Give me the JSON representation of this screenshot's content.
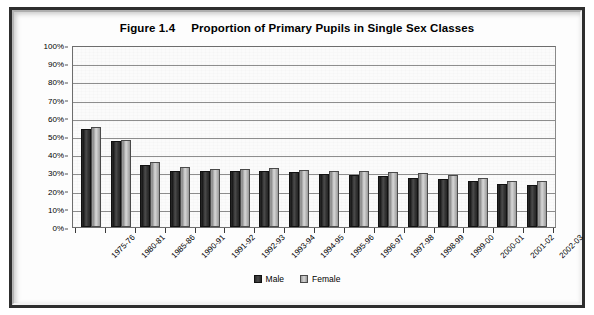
{
  "chart_data": {
    "type": "bar",
    "title_figure": "Figure 1.4",
    "title_text": "Proportion of Primary Pupils in Single Sex Classes",
    "xlabel": "",
    "ylabel": "",
    "ylim": [
      0,
      100
    ],
    "ytick_step": 10,
    "grid": true,
    "legend_position": "bottom-center",
    "y_ticks": [
      "0%",
      "10%",
      "20%",
      "30%",
      "40%",
      "50%",
      "60%",
      "70%",
      "80%",
      "90%",
      "100%"
    ],
    "categories": [
      "1975-76",
      "1980-81",
      "1985-86",
      "1990-91",
      "1991-92",
      "1992-93",
      "1993-94",
      "1994-95",
      "1995-96",
      "1996-97",
      "1997-98",
      "1998-99",
      "1999-00",
      "2000-01",
      "2001-02",
      "2002-03"
    ],
    "series": [
      {
        "name": "Male",
        "color": "#2b2b2b",
        "values": [
          54,
          47,
          34,
          31,
          30.5,
          30.5,
          31,
          30,
          29,
          28.5,
          28,
          27,
          26.5,
          25,
          23.5,
          23
        ]
      },
      {
        "name": "Female",
        "color": "#c3c3c3",
        "values": [
          55,
          48,
          35.5,
          33,
          32,
          32,
          32.5,
          31.5,
          30.5,
          30.5,
          30,
          29.5,
          28.5,
          27,
          25.5,
          25
        ]
      }
    ]
  },
  "legend": {
    "items": [
      {
        "label": "Male",
        "swatch": "male-swatch"
      },
      {
        "label": "Female",
        "swatch": "female-swatch"
      }
    ]
  }
}
